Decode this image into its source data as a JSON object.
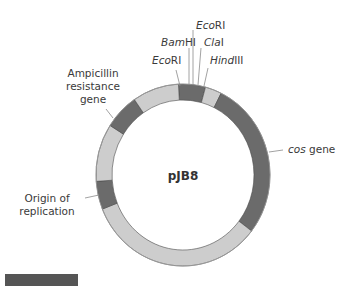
{
  "plasmid": {
    "name": "pJB8",
    "colors": {
      "light": "#cdcdcd",
      "dark": "#6b6b6b",
      "edge": "#4a4a4a"
    }
  },
  "restriction_sites": [
    {
      "enzyme_italic": "Eco",
      "enzyme_roman": "RI",
      "label": "EcoRI"
    },
    {
      "enzyme_italic": "Bam",
      "enzyme_roman": "HI",
      "label": "BamHI"
    },
    {
      "enzyme_italic": "Eco",
      "enzyme_roman": "RI",
      "label": "EcoRI"
    },
    {
      "enzyme_italic": "Cla",
      "enzyme_roman": "I",
      "label": "ClaI"
    },
    {
      "enzyme_italic": "Hind",
      "enzyme_roman": "III",
      "label": "HindIII"
    }
  ],
  "features": {
    "ampicillin": {
      "line1": "Ampicillin",
      "line2": "resistance",
      "line3": "gene"
    },
    "origin": {
      "line1": "Origin of",
      "line2": "replication"
    },
    "cos": {
      "italic": "cos",
      "roman": " gene"
    }
  },
  "segments": [
    {
      "name": "cloning-site",
      "start": -3,
      "end": 15,
      "tone": "dark"
    },
    {
      "name": "spacer-1",
      "start": 15,
      "end": 26,
      "tone": "light"
    },
    {
      "name": "cos-gene",
      "start": 26,
      "end": 128,
      "tone": "dark"
    },
    {
      "name": "backbone-bottom",
      "start": 128,
      "end": 248,
      "tone": "light"
    },
    {
      "name": "origin-of-replication",
      "start": 248,
      "end": 266,
      "tone": "dark"
    },
    {
      "name": "backbone-left",
      "start": 266,
      "end": 303,
      "tone": "light"
    },
    {
      "name": "ampicillin-resistance-gene",
      "start": 303,
      "end": 326,
      "tone": "dark"
    },
    {
      "name": "backbone-top-left",
      "start": 326,
      "end": 357,
      "tone": "light"
    }
  ]
}
